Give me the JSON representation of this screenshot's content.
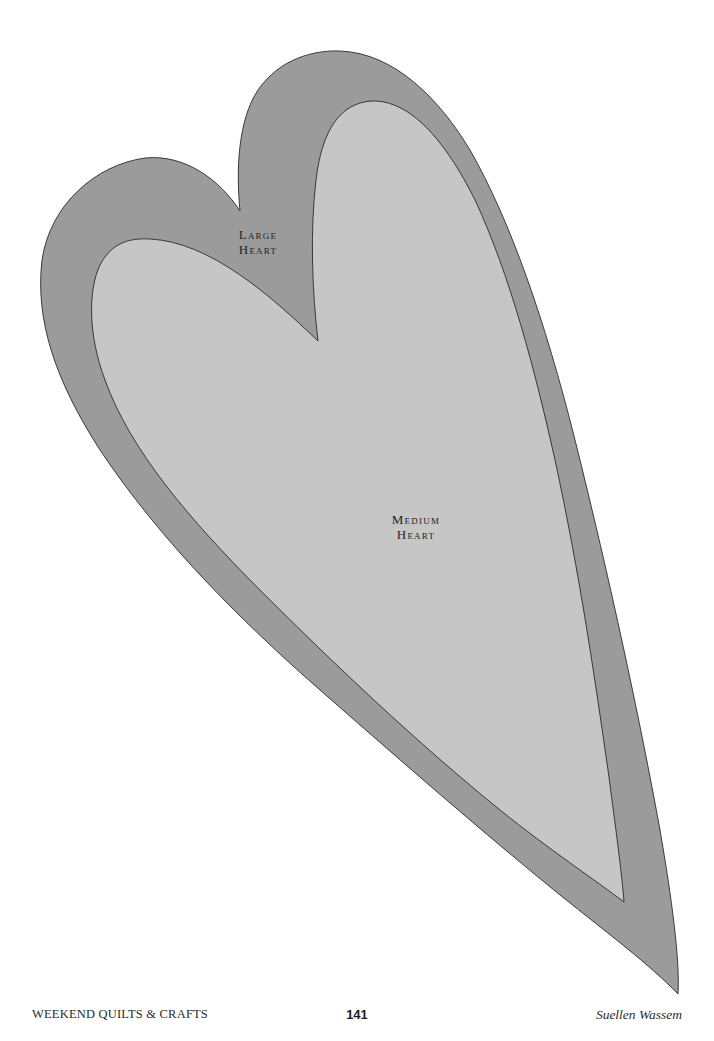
{
  "pattern": {
    "large_heart": {
      "label_line1": "Large",
      "label_line2": "Heart",
      "fill": "#9b9b9b",
      "stroke": "#2a2a2a"
    },
    "medium_heart": {
      "label_line1": "Medium",
      "label_line2": "Heart",
      "fill": "#c6c6c6",
      "stroke": "#2a2a2a"
    }
  },
  "footer": {
    "book_title": "WEEKEND QUILTS & CRAFTS",
    "page_number": "141",
    "author": "Suellen Wassem"
  }
}
